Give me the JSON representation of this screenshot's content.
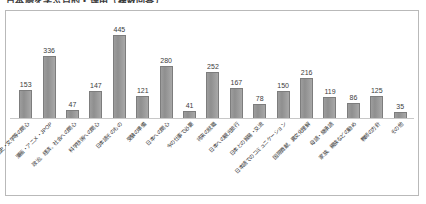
{
  "page": {
    "heading": "日本語を学ぶ目的・理由（複数回答）"
  },
  "chart_data": {
    "type": "bar",
    "title": "日本語を学ぶ目的・理由（複数回答）",
    "xlabel": "",
    "ylabel": "",
    "ylim": [
      0,
      500
    ],
    "grid": false,
    "legend": "none",
    "categories": [
      "歴史・文学等の関心",
      "漫画・アニメ・JPOP",
      "政治、経済、社会への関心",
      "科学技術への関心",
      "日本語そのもの",
      "受験の準備",
      "日本への関心",
      "今の仕事で必要",
      "将来の就職",
      "日本への観光旅行",
      "日本との貿易・交流",
      "日本語でのコミュニケーション",
      "国際貢献、異文化理解",
      "母語・継承語",
      "家族、親族などの勧め",
      "教師の方針",
      "その他"
    ],
    "values": [
      153,
      336,
      47,
      147,
      445,
      121,
      280,
      41,
      252,
      167,
      78,
      150,
      216,
      119,
      86,
      125,
      35
    ],
    "data_labels": [
      "153",
      "336",
      "47",
      "147",
      "445",
      "121",
      "280",
      "41",
      "252",
      "167",
      "78",
      "150",
      "216",
      "119",
      "86",
      "125",
      "35"
    ],
    "bar_color": "#999999",
    "bar_border_color": "#7d7d7d",
    "frame_color": "#b9b9b9",
    "background": "#ffffff"
  }
}
